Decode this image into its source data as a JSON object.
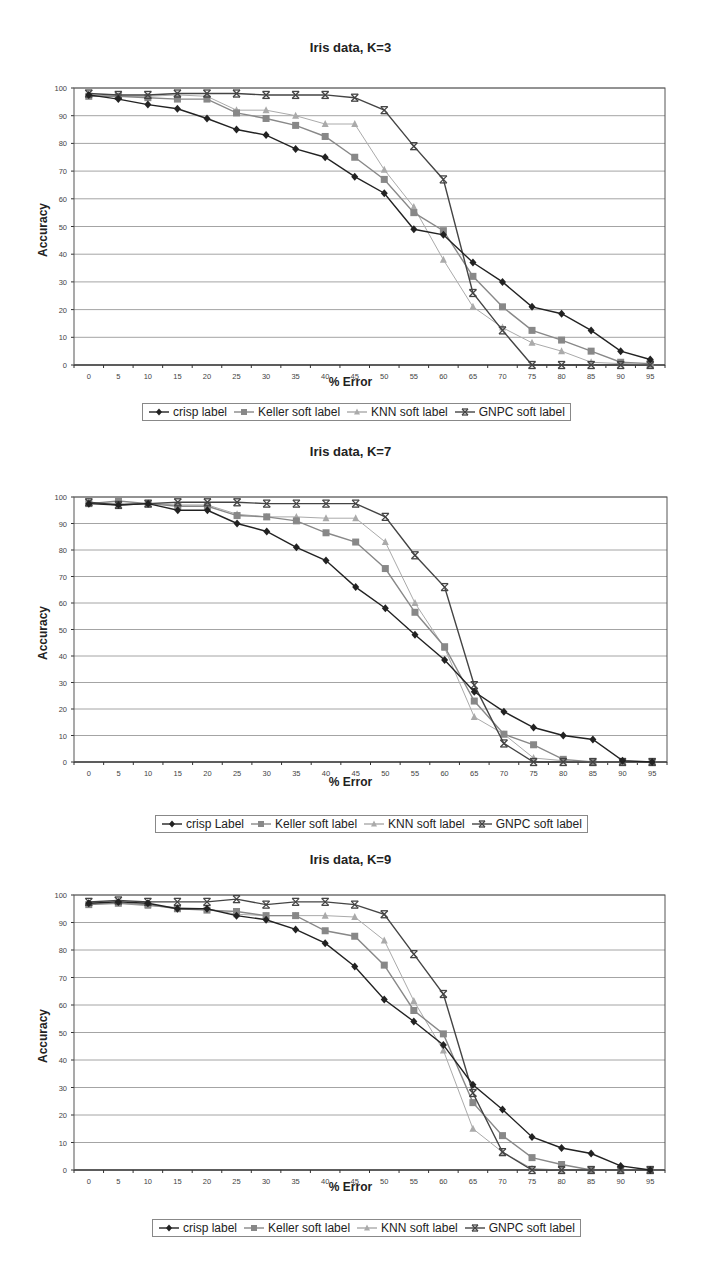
{
  "chart_data": [
    {
      "type": "line",
      "title": "Iris data, K=3",
      "xlabel": "% Error",
      "ylabel": "Accuracy",
      "x": [
        0,
        5,
        10,
        15,
        20,
        25,
        30,
        35,
        40,
        45,
        50,
        55,
        60,
        65,
        70,
        75,
        80,
        85,
        90,
        95
      ],
      "ylim": [
        0,
        100
      ],
      "yticks": [
        0,
        10,
        20,
        30,
        40,
        50,
        60,
        70,
        80,
        90,
        100
      ],
      "grid": true,
      "legend_position": "bottom",
      "series": [
        {
          "name": "crisp label",
          "marker": "diamond",
          "color": "#222222",
          "values": [
            97.5,
            96,
            94,
            92.5,
            89,
            85,
            83,
            78,
            75,
            68,
            62,
            49,
            47,
            37,
            30,
            21,
            18.5,
            12.5,
            5,
            2
          ]
        },
        {
          "name": "Keller soft label",
          "marker": "square",
          "color": "#888888",
          "values": [
            97,
            97,
            96.5,
            96,
            96,
            91,
            89,
            86.5,
            82.5,
            75,
            67,
            55,
            48.5,
            32,
            21,
            12.5,
            9,
            5,
            1,
            0.5
          ]
        },
        {
          "name": "KNN soft label",
          "marker": "triangle",
          "color": "#aaaaaa",
          "values": [
            97.5,
            97,
            97,
            97.5,
            97,
            92,
            92,
            90,
            87,
            87,
            70.5,
            57,
            38,
            21,
            13.5,
            8,
            5,
            1,
            0.5,
            0
          ]
        },
        {
          "name": "GNPC soft label",
          "marker": "star",
          "color": "#444444",
          "values": [
            98,
            97.5,
            97.5,
            98,
            98,
            98,
            97.5,
            97.5,
            97.5,
            96.5,
            92,
            79,
            67,
            26,
            12.5,
            0,
            0,
            0,
            0,
            0
          ]
        }
      ]
    },
    {
      "type": "line",
      "title": "Iris data, K=7",
      "xlabel": "% Error",
      "ylabel": "Accuracy",
      "x": [
        0,
        5,
        10,
        15,
        20,
        25,
        30,
        35,
        40,
        45,
        50,
        55,
        60,
        65,
        70,
        75,
        80,
        85,
        90,
        95
      ],
      "ylim": [
        0,
        100
      ],
      "yticks": [
        0,
        10,
        20,
        30,
        40,
        50,
        60,
        70,
        80,
        90,
        100
      ],
      "grid": true,
      "legend_position": "bottom",
      "series": [
        {
          "name": "crisp Label",
          "marker": "diamond",
          "color": "#222222",
          "values": [
            97.5,
            97,
            97.5,
            95,
            95,
            90,
            87,
            81,
            76,
            66,
            58,
            48,
            38.5,
            26.5,
            19,
            13,
            10,
            8.5,
            0.5,
            0
          ]
        },
        {
          "name": "Keller soft label",
          "marker": "square",
          "color": "#888888",
          "values": [
            97.5,
            98.5,
            97.5,
            96.5,
            96.5,
            93,
            92.5,
            91,
            86.5,
            83,
            73,
            56.5,
            43.5,
            23,
            10.5,
            6.5,
            1,
            0,
            0,
            0
          ]
        },
        {
          "name": "KNN soft label",
          "marker": "triangle",
          "color": "#aaaaaa",
          "values": [
            98,
            97.5,
            97.5,
            97,
            97,
            93.5,
            92.5,
            92.5,
            92,
            92,
            83,
            60,
            43,
            17,
            10.5,
            1.5,
            0.5,
            0,
            0,
            0
          ]
        },
        {
          "name": "GNPC soft label",
          "marker": "star",
          "color": "#444444",
          "values": [
            98,
            97,
            97.5,
            98,
            98,
            98,
            97.5,
            97.5,
            97.5,
            97.5,
            92.5,
            78,
            66,
            29,
            7,
            0,
            0,
            0,
            0,
            0
          ]
        }
      ]
    },
    {
      "type": "line",
      "title": "Iris data, K=9",
      "xlabel": "% Error",
      "ylabel": "Accuracy",
      "x": [
        0,
        5,
        10,
        15,
        20,
        25,
        30,
        35,
        40,
        45,
        50,
        55,
        60,
        65,
        70,
        75,
        80,
        85,
        90,
        95
      ],
      "ylim": [
        0,
        100
      ],
      "yticks": [
        0,
        10,
        20,
        30,
        40,
        50,
        60,
        70,
        80,
        90,
        100
      ],
      "grid": true,
      "legend_position": "bottom",
      "series": [
        {
          "name": "crisp label",
          "marker": "diamond",
          "color": "#222222",
          "values": [
            97,
            97.5,
            97,
            95,
            95,
            92.5,
            91,
            87.5,
            82.5,
            74,
            62,
            54,
            45.5,
            31,
            22,
            12,
            8,
            6,
            1.5,
            0
          ]
        },
        {
          "name": "Keller soft label",
          "marker": "square",
          "color": "#888888",
          "values": [
            96.5,
            97,
            96.5,
            95,
            94.5,
            94,
            92.5,
            92.5,
            87,
            85,
            74.5,
            58,
            49.5,
            24.5,
            12.5,
            4.5,
            2,
            0,
            0,
            0
          ]
        },
        {
          "name": "KNN soft label",
          "marker": "triangle",
          "color": "#aaaaaa",
          "values": [
            97,
            97,
            96,
            95.5,
            95,
            93,
            92.5,
            92.5,
            92.5,
            92,
            83.5,
            61.5,
            43.5,
            15,
            6.5,
            0.5,
            0,
            0,
            0,
            0
          ]
        },
        {
          "name": "GNPC soft label",
          "marker": "star",
          "color": "#444444",
          "values": [
            97.5,
            98,
            97.5,
            97.5,
            97.5,
            98.5,
            96.5,
            97.5,
            97.5,
            96.5,
            93,
            78.5,
            64,
            28,
            6.5,
            0,
            0,
            0,
            0,
            0
          ]
        }
      ]
    }
  ],
  "layout": [
    {
      "title_top": 40,
      "plot": {
        "left": 74,
        "right": 665,
        "top": 88,
        "bottom": 365
      },
      "xlabel_top": 375,
      "legend": {
        "left": 142,
        "top": 403
      }
    },
    {
      "title_top": 444,
      "plot": {
        "left": 74,
        "right": 667,
        "top": 497,
        "bottom": 762
      },
      "xlabel_top": 775,
      "legend": {
        "left": 155,
        "top": 815
      }
    },
    {
      "title_top": 852,
      "plot": {
        "left": 74,
        "right": 665,
        "top": 895,
        "bottom": 1170
      },
      "xlabel_top": 1180,
      "legend": {
        "left": 152,
        "top": 1219
      }
    }
  ]
}
